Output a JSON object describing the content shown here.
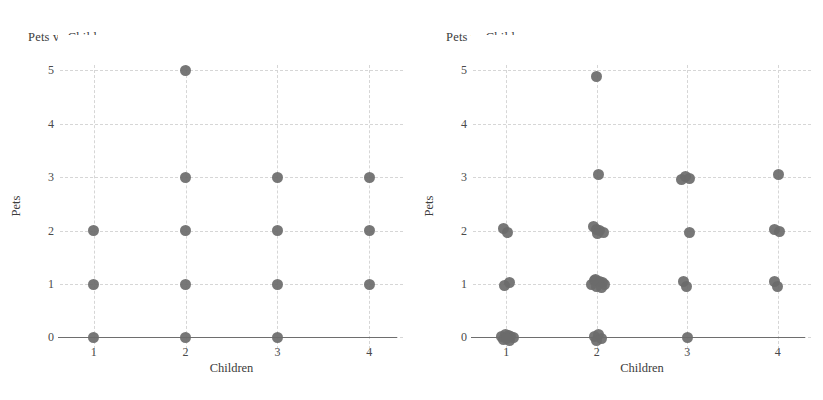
{
  "figure": {
    "background": "#ffffff",
    "marker_color": "#6b6b6b",
    "grid_color": "#d6d6d6",
    "axis_color": "#6e6e6e",
    "width": 823,
    "height": 400
  },
  "panels": [
    {
      "id": "left",
      "title": "Pets vs Children"
    },
    {
      "id": "right",
      "title": "Pets vs Children"
    }
  ],
  "axes": {
    "xlabel": "Children",
    "ylabel": "Pets",
    "xticks": [
      "1",
      "2",
      "3",
      "4"
    ],
    "yticks": [
      "0",
      "1",
      "2",
      "3",
      "4",
      "5"
    ]
  },
  "chart_data": [
    {
      "type": "scatter",
      "title": "Pets vs Children",
      "xlabel": "Children",
      "ylabel": "Pets",
      "xlim": [
        0.72,
        4.28
      ],
      "ylim": [
        -0.16,
        5.1
      ],
      "xticks": [
        1,
        2,
        3,
        4
      ],
      "yticks": [
        0,
        1,
        2,
        3,
        4,
        5
      ],
      "grid": true,
      "legend": null,
      "note": "unjittered — overplotted integer pairs collapse to single markers",
      "points": [
        {
          "x": 1,
          "y": 0
        },
        {
          "x": 1,
          "y": 1
        },
        {
          "x": 1,
          "y": 2
        },
        {
          "x": 2,
          "y": 0
        },
        {
          "x": 2,
          "y": 1
        },
        {
          "x": 2,
          "y": 2
        },
        {
          "x": 2,
          "y": 3
        },
        {
          "x": 2,
          "y": 5
        },
        {
          "x": 3,
          "y": 0
        },
        {
          "x": 3,
          "y": 1
        },
        {
          "x": 3,
          "y": 2
        },
        {
          "x": 3,
          "y": 3
        },
        {
          "x": 4,
          "y": 1
        },
        {
          "x": 4,
          "y": 2
        },
        {
          "x": 4,
          "y": 3
        }
      ]
    },
    {
      "type": "scatter",
      "title": "Pets vs Children",
      "xlabel": "Children",
      "ylabel": "Pets",
      "xlim": [
        0.72,
        4.28
      ],
      "ylim": [
        -0.16,
        5.1
      ],
      "xticks": [
        1,
        2,
        3,
        4
      ],
      "yticks": [
        0,
        1,
        2,
        3,
        4,
        5
      ],
      "grid": true,
      "legend": null,
      "note": "jittered — same data with small random offsets revealing overplotting density",
      "points": [
        {
          "x": 0.95,
          "y": 0.02
        },
        {
          "x": 0.99,
          "y": 0.05
        },
        {
          "x": 1.02,
          "y": 0.03
        },
        {
          "x": 1.05,
          "y": 0.01
        },
        {
          "x": 0.97,
          "y": -0.04
        },
        {
          "x": 1.04,
          "y": -0.06
        },
        {
          "x": 1.08,
          "y": 0.0
        },
        {
          "x": 1.0,
          "y": -0.02
        },
        {
          "x": 0.98,
          "y": 0.98
        },
        {
          "x": 1.03,
          "y": 1.03
        },
        {
          "x": 0.97,
          "y": 2.04
        },
        {
          "x": 1.01,
          "y": 1.96
        },
        {
          "x": 1.98,
          "y": 0.02
        },
        {
          "x": 2.02,
          "y": 0.05
        },
        {
          "x": 2.05,
          "y": -0.02
        },
        {
          "x": 2.0,
          "y": -0.05
        },
        {
          "x": 1.94,
          "y": 1.0
        },
        {
          "x": 1.97,
          "y": 1.06
        },
        {
          "x": 2.0,
          "y": 0.95
        },
        {
          "x": 2.03,
          "y": 1.04
        },
        {
          "x": 2.06,
          "y": 1.02
        },
        {
          "x": 2.09,
          "y": 0.99
        },
        {
          "x": 1.99,
          "y": 1.08
        },
        {
          "x": 2.05,
          "y": 0.93
        },
        {
          "x": 1.96,
          "y": 2.08
        },
        {
          "x": 2.0,
          "y": 2.03
        },
        {
          "x": 2.03,
          "y": 2.0
        },
        {
          "x": 2.07,
          "y": 1.97
        },
        {
          "x": 2.01,
          "y": 1.95
        },
        {
          "x": 2.02,
          "y": 3.05
        },
        {
          "x": 2.0,
          "y": 4.89
        },
        {
          "x": 3.0,
          "y": 0.0
        },
        {
          "x": 2.96,
          "y": 1.04
        },
        {
          "x": 2.99,
          "y": 0.96
        },
        {
          "x": 3.02,
          "y": 1.97
        },
        {
          "x": 2.94,
          "y": 2.96
        },
        {
          "x": 2.98,
          "y": 3.02
        },
        {
          "x": 3.03,
          "y": 2.97
        },
        {
          "x": 3.96,
          "y": 1.04
        },
        {
          "x": 4.0,
          "y": 0.95
        },
        {
          "x": 3.97,
          "y": 2.02
        },
        {
          "x": 4.02,
          "y": 1.99
        },
        {
          "x": 4.01,
          "y": 3.05
        }
      ]
    }
  ]
}
